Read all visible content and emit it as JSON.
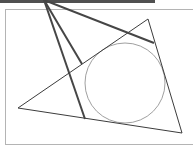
{
  "figure": {
    "type": "geometry-diagram",
    "colors": {
      "frame": "#b4b4b4",
      "top_bar": "#505050",
      "triangle": "#3c3c3c",
      "thick_lines": "#464646",
      "circle": "#a0a0a0"
    }
  }
}
